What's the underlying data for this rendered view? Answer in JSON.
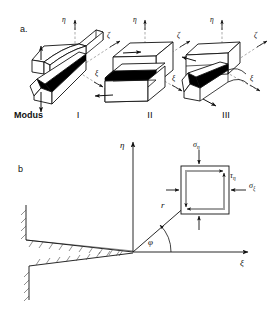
{
  "figure": {
    "panels": [
      {
        "id": "a",
        "label": "a.",
        "row_label": "Modus",
        "axes": {
          "eta": "η",
          "zeta": "ζ",
          "xi": "ξ"
        },
        "modes": [
          {
            "numeral": "I",
            "name": "mode-i-opening"
          },
          {
            "numeral": "II",
            "name": "mode-ii-in-plane-shear"
          },
          {
            "numeral": "III",
            "name": "mode-iii-out-of-plane-shear"
          }
        ]
      },
      {
        "id": "b",
        "label": "b",
        "axes": {
          "vertical": "η",
          "horizontal": "ξ"
        },
        "annotations": {
          "radius": "r",
          "angle": "φ"
        },
        "stress_element": {
          "sigma_eta": {
            "sym": "σ",
            "sub": "η"
          },
          "sigma_xi": {
            "sym": "σ",
            "sub": "ξ"
          },
          "tau": {
            "sym": "τ",
            "sub": "η"
          }
        }
      }
    ]
  },
  "colors": {
    "ink": "#111111",
    "line": "#1a1a1a",
    "crack_fill": "#000000",
    "hatch": "#333333",
    "paper": "#ffffff"
  }
}
